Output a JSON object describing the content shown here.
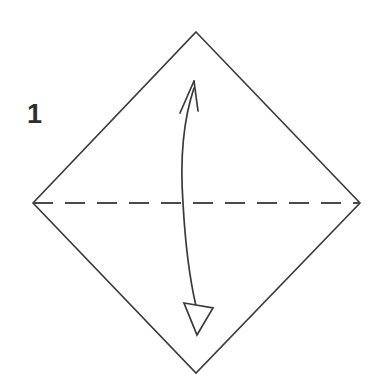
{
  "figure": {
    "kind": "origami-fold-diagram",
    "step_label": "1",
    "background_color": "#ffffff",
    "line_color": "#3a3a3a",
    "dash_color": "#4a4a4a",
    "text_color": "#2e2e2e"
  },
  "labels": {
    "step_number": "1"
  },
  "shapes": {
    "paper": {
      "name": "square-paper-rotated-45",
      "outline_points": "196,32 360,203 196,373 33,203",
      "stroke_width": 1.6,
      "fill": "none"
    },
    "crease": {
      "name": "horizontal-valley-crease",
      "x1": 33,
      "y1": 203,
      "x2": 360,
      "y2": 203,
      "style": "dashed",
      "dash_pattern": "20 12",
      "stroke_width": 1.8
    },
    "arrow": {
      "name": "fold-and-unfold-double-arrow",
      "shaft_path": "M 194,88 C 180,130 181,175 183,203 C 185,240 190,280 196,306",
      "stroke_width": 1.7,
      "head_up": {
        "type": "open-barbed",
        "tip": "194,81",
        "left_barb": "180,113",
        "right_barb": "198,111"
      },
      "head_down": {
        "type": "hollow-triangle",
        "points": "184,303 213,308 197,335"
      }
    }
  },
  "annotations": {
    "step_number_position": {
      "x": 27,
      "y": 123
    }
  }
}
